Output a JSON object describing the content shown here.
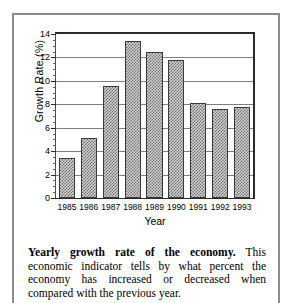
{
  "figure": {
    "caption_lead": "Yearly growth rate of the economy.",
    "caption_body": "This economic indicator tells by what percent the economy has increased or decreased when compared with the previous year."
  },
  "chart_data": {
    "type": "bar",
    "title": "",
    "xlabel": "Year",
    "ylabel": "Growth Rate (%)",
    "categories": [
      "1985",
      "1986",
      "1987",
      "1988",
      "1989",
      "1990",
      "1991",
      "1992",
      "1993"
    ],
    "values": [
      3.4,
      5.1,
      9.6,
      13.4,
      12.5,
      11.8,
      8.1,
      7.6,
      7.8
    ],
    "ylim": [
      0,
      14
    ],
    "ytick_labels": [
      "0",
      "2",
      "4",
      "6",
      "8",
      "10",
      "12",
      "14"
    ],
    "ytick_values": [
      0,
      2,
      4,
      6,
      8,
      10,
      12,
      14
    ],
    "minor_tick_step": 0.5,
    "grid": "horizontal",
    "legend": "none",
    "bar_fill": "#d2d2d2",
    "bar_pattern": "checkered-halftone",
    "bar_edge_color": "#3a3a3a",
    "gridline_color": "#808080",
    "axis_color": "#2b2b2b"
  }
}
